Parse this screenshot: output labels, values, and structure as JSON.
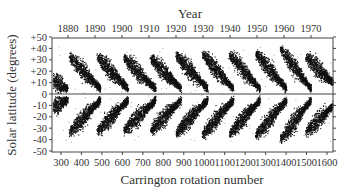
{
  "chart_data": {
    "type": "scatter",
    "title": "",
    "subtitle": "Sunspot butterfly diagram",
    "top_axis": {
      "label": "Year",
      "ticks": [
        1880,
        1890,
        1900,
        1910,
        1920,
        1930,
        1940,
        1950,
        1960,
        1970
      ]
    },
    "xlabel": "Carrington rotation number",
    "xticks": [
      300,
      400,
      500,
      600,
      700,
      800,
      900,
      1000,
      1100,
      1200,
      1300,
      1400,
      1500,
      1600
    ],
    "xlim": [
      255,
      1650
    ],
    "ylabel": "Solar latitude (degrees)",
    "yticks": [
      "+50",
      "+40",
      "+30",
      "+20",
      "+10",
      "0",
      "-10",
      "-20",
      "-30",
      "-40",
      "-50"
    ],
    "ylim": [
      -50,
      50
    ],
    "grid": false,
    "legend": null,
    "reference_line": {
      "y": 0,
      "label": "equator"
    },
    "series": [
      {
        "name": "Cycle (partial)",
        "start_rotation": 255,
        "end_rotation": 330,
        "start_latitude": 12,
        "end_latitude": 5
      },
      {
        "name": "Cycle 12-13",
        "start_rotation": 340,
        "end_rotation": 490,
        "start_latitude": 33,
        "end_latitude": 5
      },
      {
        "name": "Cycle 13-14",
        "start_rotation": 475,
        "end_rotation": 625,
        "start_latitude": 33,
        "end_latitude": 5
      },
      {
        "name": "Cycle 14-15",
        "start_rotation": 605,
        "end_rotation": 760,
        "start_latitude": 32,
        "end_latitude": 5
      },
      {
        "name": "Cycle 15-16",
        "start_rotation": 735,
        "end_rotation": 885,
        "start_latitude": 32,
        "end_latitude": 5
      },
      {
        "name": "Cycle 16-17",
        "start_rotation": 860,
        "end_rotation": 1015,
        "start_latitude": 34,
        "end_latitude": 5
      },
      {
        "name": "Cycle 17-18",
        "start_rotation": 990,
        "end_rotation": 1140,
        "start_latitude": 35,
        "end_latitude": 5
      },
      {
        "name": "Cycle 18-19",
        "start_rotation": 1120,
        "end_rotation": 1270,
        "start_latitude": 35,
        "end_latitude": 5
      },
      {
        "name": "Cycle 19-20",
        "start_rotation": 1250,
        "end_rotation": 1400,
        "start_latitude": 36,
        "end_latitude": 5
      },
      {
        "name": "Cycle 20-21",
        "start_rotation": 1370,
        "end_rotation": 1520,
        "start_latitude": 40,
        "end_latitude": 5
      },
      {
        "name": "Cycle 21 (partial)",
        "start_rotation": 1495,
        "end_rotation": 1640,
        "start_latitude": 33,
        "end_latitude": 8
      }
    ]
  },
  "labels": {
    "top_axis_title": "Year",
    "x_axis_title": "Carrington rotation number",
    "y_axis_title": "Solar latitude (degrees)"
  },
  "colors": {
    "dots": "#111111",
    "axis": "#333333",
    "background": "#ffffff"
  }
}
